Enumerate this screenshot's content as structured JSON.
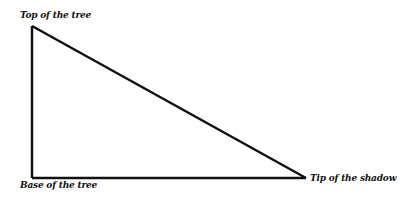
{
  "diagram": {
    "type": "right-triangle",
    "labels": {
      "top": "Top of the tree",
      "base": "Base of the tree",
      "tip": "Tip of the shadow"
    },
    "vertices": {
      "top": [
        32,
        26
      ],
      "base": [
        32,
        178
      ],
      "tip": [
        306,
        178
      ]
    },
    "stroke_color": "#111111"
  }
}
